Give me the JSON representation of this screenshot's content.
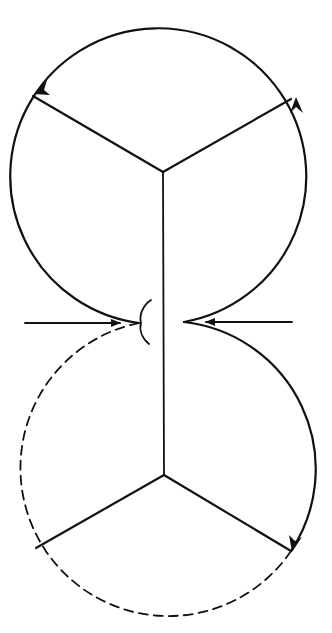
{
  "diagram": {
    "title": "",
    "colors": {
      "stroke": "#111111",
      "background": "#ffffff"
    },
    "upper_circle": {
      "cx": 163,
      "cy": 172,
      "r": 148,
      "style": "solid"
    },
    "lower_circle": {
      "cx": 164,
      "cy": 475,
      "r": 148,
      "style": "partly dashed"
    },
    "arrows": [
      {
        "name": "left-inward-arrow",
        "from": [
          25,
          323
        ],
        "to": [
          122,
          323
        ]
      },
      {
        "name": "right-inward-arrow",
        "from": [
          292,
          322
        ],
        "to": [
          204,
          322
        ]
      }
    ],
    "labels": []
  }
}
